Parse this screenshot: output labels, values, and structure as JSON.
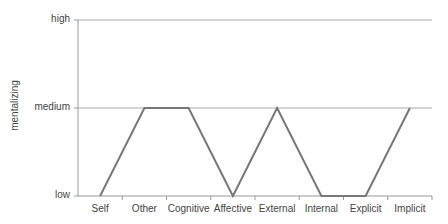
{
  "chart_data": {
    "type": "line",
    "title": "",
    "xlabel": "",
    "ylabel": "mentalizing",
    "categories": [
      "Self",
      "Other",
      "Cognitive",
      "Affective",
      "External",
      "Internal",
      "Explicit",
      "Implicit"
    ],
    "y_levels": [
      "low",
      "medium",
      "high"
    ],
    "values": [
      0,
      1,
      1,
      0,
      1,
      0,
      0,
      1
    ],
    "value_labels": [
      "low",
      "medium",
      "medium",
      "low",
      "medium",
      "low",
      "low",
      "medium"
    ],
    "ylim": [
      0,
      2
    ],
    "grid": true,
    "legend": "none",
    "colors": {
      "line": "#777777",
      "grid": "#aaaaaa",
      "axis": "#999999"
    }
  },
  "axis": {
    "y_title": "mentalizing",
    "y_ticks": [
      "high",
      "medium",
      "low"
    ],
    "x_ticks": [
      "Self",
      "Other",
      "Cognitive",
      "Affective",
      "External",
      "Internal",
      "Explicit",
      "Implicit"
    ]
  }
}
